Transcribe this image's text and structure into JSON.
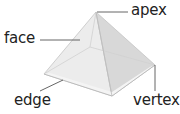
{
  "diagram": {
    "labels": {
      "apex": "apex",
      "face": "face",
      "edge": "edge",
      "vertex": "vertex"
    },
    "colors": {
      "face_left": "#ececec",
      "face_front": "#e6e6e6",
      "face_right": "#d6d6d6",
      "base_back": "#f0f0f0",
      "edge_line": "#bdbdbd",
      "leader_line": "#555555",
      "text": "#222222"
    }
  }
}
